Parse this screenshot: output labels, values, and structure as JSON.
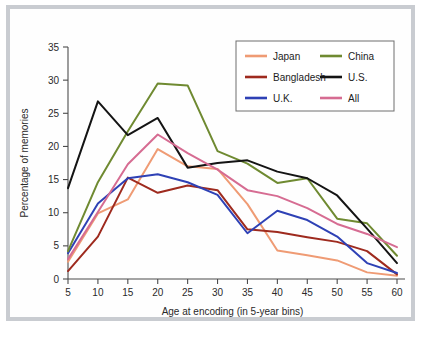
{
  "chart_data": {
    "type": "line",
    "title": "",
    "xlabel": "Age at encoding (in 5-year bins)",
    "ylabel": "Percentage of memories",
    "x": [
      5,
      10,
      15,
      20,
      25,
      30,
      35,
      40,
      45,
      50,
      55,
      60
    ],
    "categories": [
      "5",
      "10",
      "15",
      "20",
      "25",
      "30",
      "35",
      "40",
      "45",
      "50",
      "55",
      "60"
    ],
    "xlim": [
      5,
      60
    ],
    "ylim": [
      0,
      35
    ],
    "yticks": [
      0,
      5,
      10,
      15,
      20,
      25,
      30,
      35
    ],
    "xticks": [
      5,
      10,
      15,
      20,
      25,
      30,
      35,
      40,
      45,
      50,
      55,
      60
    ],
    "grid": false,
    "legend_position": "top-right",
    "series": [
      {
        "name": "Japan",
        "color": "#ef9b74",
        "values": [
          2.6,
          9.9,
          12.0,
          19.6,
          17.0,
          16.6,
          11.3,
          4.3,
          3.6,
          2.8,
          1.0,
          0.5
        ]
      },
      {
        "name": "Bangladesh",
        "color": "#9e2a1e",
        "values": [
          1.2,
          6.4,
          15.3,
          13.0,
          14.1,
          13.4,
          7.5,
          7.1,
          6.3,
          5.6,
          4.2,
          0.7
        ]
      },
      {
        "name": "U.K.",
        "color": "#2e41b5",
        "values": [
          3.9,
          11.4,
          15.2,
          15.8,
          14.6,
          12.7,
          6.9,
          10.3,
          8.9,
          6.4,
          2.4,
          0.9
        ]
      },
      {
        "name": "China",
        "color": "#6f8a31",
        "values": [
          4.2,
          14.6,
          22.3,
          29.5,
          29.2,
          19.3,
          17.4,
          14.5,
          15.2,
          9.1,
          8.4,
          3.5
        ]
      },
      {
        "name": "U.S.",
        "color": "#141414",
        "values": [
          13.7,
          26.8,
          21.7,
          24.3,
          16.8,
          17.5,
          17.9,
          16.2,
          15.2,
          12.6,
          7.6,
          2.4
        ]
      },
      {
        "name": "All",
        "color": "#d66c92",
        "values": [
          3.0,
          10.1,
          17.3,
          21.8,
          19.0,
          16.5,
          13.4,
          12.5,
          10.7,
          8.3,
          6.8,
          4.8
        ]
      }
    ],
    "legend_entries": [
      {
        "label": "Japan",
        "color": "#ef9b74"
      },
      {
        "label": "China",
        "color": "#6f8a31"
      },
      {
        "label": "Bangladesh",
        "color": "#9e2a1e"
      },
      {
        "label": "U.S.",
        "color": "#141414"
      },
      {
        "label": "U.K.",
        "color": "#2e41b5"
      },
      {
        "label": "All",
        "color": "#d66c92"
      }
    ]
  },
  "axes": {
    "y_tick_labels": [
      "0",
      "5",
      "10",
      "15",
      "20",
      "25",
      "30",
      "35"
    ],
    "x_tick_labels": [
      "5",
      "10",
      "15",
      "20",
      "25",
      "30",
      "35",
      "40",
      "45",
      "50",
      "55",
      "60"
    ],
    "x_title": "Age at encoding (in 5-year bins)",
    "y_title": "Percentage of memories"
  },
  "legend": {
    "col1": [
      {
        "label": "Japan"
      },
      {
        "label": "Bangladesh"
      },
      {
        "label": "U.K."
      }
    ],
    "col2": [
      {
        "label": "China"
      },
      {
        "label": "U.S."
      },
      {
        "label": "All"
      }
    ]
  },
  "colors": {
    "japan": "#ef9b74",
    "bangladesh": "#9e2a1e",
    "uk": "#2e41b5",
    "china": "#6f8a31",
    "us": "#141414",
    "all": "#d66c92",
    "frame": "#c9ccd1",
    "axis": "#4b4b4b",
    "background": "#fefefe"
  }
}
